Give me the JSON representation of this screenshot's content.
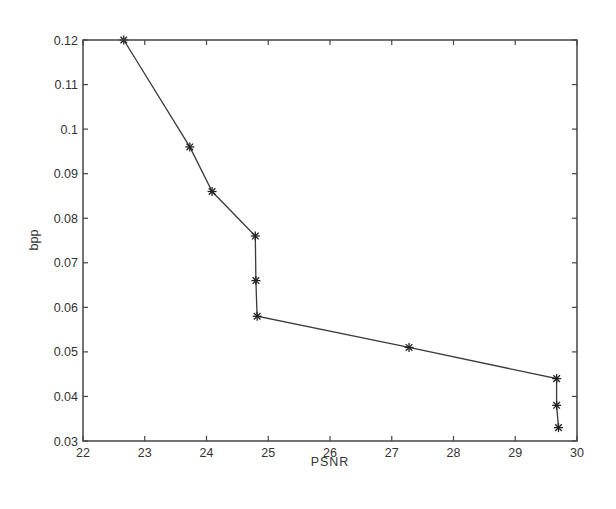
{
  "chart_data": {
    "type": "line",
    "title": "",
    "xlabel": "PSNR",
    "ylabel": "bpp",
    "xlim": [
      22,
      30
    ],
    "ylim": [
      0.03,
      0.12
    ],
    "xticks": [
      22,
      23,
      24,
      25,
      26,
      27,
      28,
      29,
      30
    ],
    "yticks": [
      0.03,
      0.04,
      0.05,
      0.06,
      0.07,
      0.08,
      0.09,
      0.1,
      0.11,
      0.12
    ],
    "xtick_labels": [
      "22",
      "23",
      "24",
      "25",
      "26",
      "27",
      "28",
      "29",
      "30"
    ],
    "ytick_labels": [
      "0.03",
      "0.04",
      "0.05",
      "0.06",
      "0.07",
      "0.08",
      "0.09",
      "0.1",
      "0.11",
      "0.12"
    ],
    "grid": false,
    "legend": null,
    "series": [
      {
        "name": "bpp vs PSNR",
        "marker": "asterisk",
        "color": "#333333",
        "x": [
          22.66,
          23.73,
          24.09,
          24.79,
          24.8,
          24.82,
          27.28,
          29.67,
          29.67,
          29.7
        ],
        "y": [
          0.12,
          0.096,
          0.086,
          0.076,
          0.066,
          0.058,
          0.051,
          0.044,
          0.038,
          0.033
        ]
      }
    ]
  }
}
